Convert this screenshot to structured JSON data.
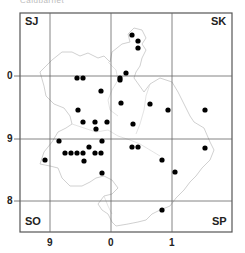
{
  "title": "Caldbarnet",
  "map": {
    "frame": {
      "x1": 20,
      "y1": 13,
      "x2": 232,
      "y2": 232
    },
    "gridlines_x": [
      50,
      111,
      172
    ],
    "gridlines_y": [
      76,
      139,
      201
    ],
    "squares": {
      "nw": "SJ",
      "ne": "SK",
      "sw": "SO",
      "se": "SP"
    },
    "x_ticks": [
      {
        "label": "9",
        "x": 50
      },
      {
        "label": "0",
        "x": 111
      },
      {
        "label": "1",
        "x": 172
      }
    ],
    "y_ticks": [
      {
        "label": "0",
        "y": 76
      },
      {
        "label": "9",
        "y": 139
      },
      {
        "label": "8",
        "y": 201
      }
    ],
    "colors": {
      "grid": "#555555",
      "boundary": "#bdbdbd",
      "dot": "#000000"
    }
  },
  "chart_data": {
    "type": "scatter",
    "title": "",
    "x_tick_labels": [
      "9",
      "0",
      "1"
    ],
    "y_tick_labels": [
      "0",
      "9",
      "8"
    ],
    "grid_squares": [
      "SJ",
      "SK",
      "SO",
      "SP"
    ],
    "points_px": [
      [
        132,
        35
      ],
      [
        138,
        41
      ],
      [
        138,
        48
      ],
      [
        126,
        73
      ],
      [
        120,
        80
      ],
      [
        77,
        78
      ],
      [
        83,
        78
      ],
      [
        120,
        78
      ],
      [
        101,
        91
      ],
      [
        121,
        103
      ],
      [
        150,
        104
      ],
      [
        78,
        110
      ],
      [
        168,
        110
      ],
      [
        205,
        110
      ],
      [
        83,
        122
      ],
      [
        95,
        122
      ],
      [
        96,
        129
      ],
      [
        107,
        122
      ],
      [
        133,
        124
      ],
      [
        59,
        141
      ],
      [
        102,
        141
      ],
      [
        89,
        147
      ],
      [
        132,
        147
      ],
      [
        138,
        147
      ],
      [
        65,
        153
      ],
      [
        71,
        153
      ],
      [
        77,
        153
      ],
      [
        83,
        153
      ],
      [
        95,
        153
      ],
      [
        101,
        153
      ],
      [
        84,
        161
      ],
      [
        45,
        160
      ],
      [
        162,
        160
      ],
      [
        205,
        148
      ],
      [
        102,
        173
      ],
      [
        175,
        172
      ],
      [
        162,
        210
      ]
    ]
  }
}
